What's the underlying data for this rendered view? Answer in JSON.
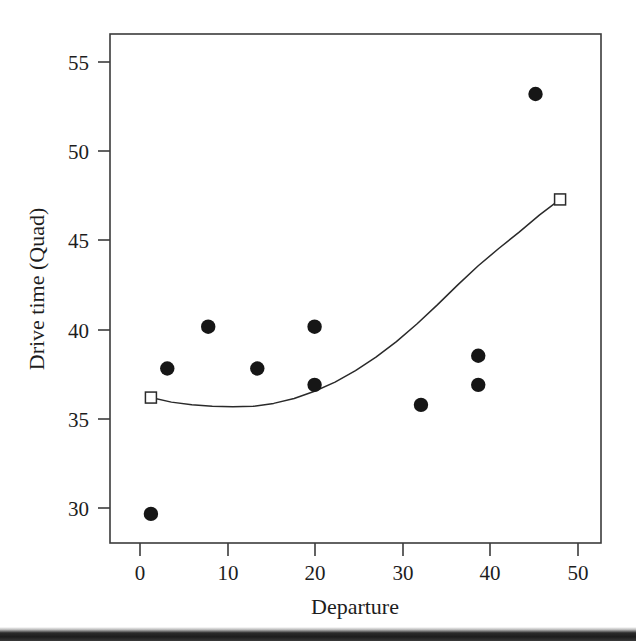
{
  "figure": {
    "background_color": "#ffffff",
    "ink_color": "#1d1d1d",
    "scan_artifact_band": "bottom-dark-strip"
  },
  "chart_data": {
    "type": "scatter",
    "title": "",
    "subtitle": "",
    "xlabel": "Departure",
    "ylabel": "Drive time (Quad)",
    "xlim": [
      -5,
      55
    ],
    "ylim": [
      28.5,
      56.5
    ],
    "xticks": [
      0,
      10,
      20,
      30,
      40,
      50
    ],
    "xtick_labels": [
      "0",
      "10",
      "20",
      "30",
      "40",
      "50"
    ],
    "yticks": [
      30,
      35,
      40,
      45,
      50,
      55
    ],
    "ytick_labels": [
      "30",
      "35",
      "40",
      "45",
      "50",
      "55"
    ],
    "grid": false,
    "legend": false,
    "legend_position": "none",
    "frame": "box",
    "series": [
      {
        "name": "Observed drive time",
        "type": "scatter",
        "marker": "filled-circle",
        "marker_color": "#161616",
        "x": [
          0,
          2,
          7,
          13,
          20,
          20,
          33,
          40,
          40,
          47
        ],
        "y": [
          30.1,
          38.1,
          40.4,
          38.1,
          40.4,
          37.2,
          36.1,
          38.8,
          37.2,
          53.2
        ],
        "points": [
          {
            "x": 0,
            "y": 30.1
          },
          {
            "x": 2,
            "y": 38.1
          },
          {
            "x": 7,
            "y": 40.4
          },
          {
            "x": 13,
            "y": 38.1
          },
          {
            "x": 20,
            "y": 40.4
          },
          {
            "x": 20,
            "y": 37.2
          },
          {
            "x": 33,
            "y": 36.1
          },
          {
            "x": 40,
            "y": 38.8
          },
          {
            "x": 40,
            "y": 37.2
          },
          {
            "x": 47,
            "y": 53.2
          }
        ]
      },
      {
        "name": "Quadratic fit",
        "type": "line",
        "marker": "open-square-endpoints",
        "line_color": "#2a2a2a",
        "endpoint_marker_color": "#ffffff",
        "x": [
          0,
          2.5,
          5,
          7.5,
          10,
          12.5,
          15,
          17.5,
          20,
          22.5,
          25,
          27.5,
          30,
          32.5,
          35,
          37.5,
          40,
          42.5,
          45,
          47.5,
          50
        ],
        "y": [
          36.5,
          36.25,
          36.1,
          36.02,
          36.0,
          36.02,
          36.18,
          36.45,
          36.85,
          37.35,
          37.98,
          38.72,
          39.58,
          40.55,
          41.6,
          42.7,
          43.75,
          44.7,
          45.6,
          46.55,
          47.4
        ],
        "endpoints": [
          {
            "x": 0,
            "y": 36.5
          },
          {
            "x": 50,
            "y": 47.4
          }
        ],
        "minimum": {
          "x": 10,
          "y": 36.0
        }
      }
    ]
  }
}
